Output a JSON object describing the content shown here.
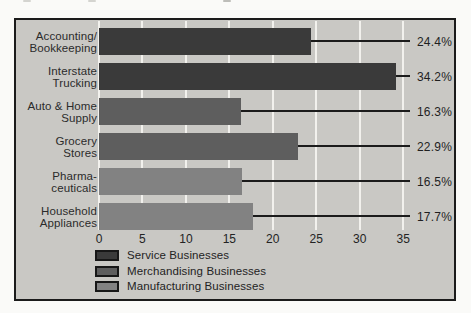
{
  "chart_data": {
    "type": "bar",
    "orientation": "horizontal",
    "title": "",
    "xlabel": "",
    "ylabel": "",
    "xlim": [
      0,
      35
    ],
    "x_ticks": [
      0,
      5,
      10,
      15,
      20,
      25,
      30,
      35
    ],
    "grid": true,
    "rows": [
      {
        "category_lines": [
          "Accounting/",
          "Bookkeeping"
        ],
        "value": 24.4,
        "value_label": "24.4%",
        "series": "Service Businesses"
      },
      {
        "category_lines": [
          "Interstate",
          "Trucking"
        ],
        "value": 34.2,
        "value_label": "34.2%",
        "series": "Service Businesses"
      },
      {
        "category_lines": [
          "Auto & Home",
          "Supply"
        ],
        "value": 16.3,
        "value_label": "16.3%",
        "series": "Merchandising Businesses"
      },
      {
        "category_lines": [
          "Grocery",
          "Stores"
        ],
        "value": 22.9,
        "value_label": "22.9%",
        "series": "Merchandising Businesses"
      },
      {
        "category_lines": [
          "Pharma-",
          "ceuticals"
        ],
        "value": 16.5,
        "value_label": "16.5%",
        "series": "Manufacturing Businesses"
      },
      {
        "category_lines": [
          "Household",
          "Appliances"
        ],
        "value": 17.7,
        "value_label": "17.7%",
        "series": "Manufacturing Businesses"
      }
    ],
    "legend": [
      {
        "label": "Service Businesses",
        "color": "#3a3a3a"
      },
      {
        "label": "Merchandising Businesses",
        "color": "#5e5e5e"
      },
      {
        "label": "Manufacturing Businesses",
        "color": "#828282"
      }
    ],
    "legend_position": "bottom-left"
  },
  "colors": {
    "page_background": "#fafaf8",
    "chart_background": "#c9c8c4",
    "chart_border": "#1b1b1b",
    "gridline": "#f2f1ed",
    "leader_line": "#1b1b1b",
    "text": "#2b2b2b",
    "series": {
      "Service Businesses": "#3a3a3a",
      "Merchandising Businesses": "#5e5e5e",
      "Manufacturing Businesses": "#828282"
    }
  }
}
